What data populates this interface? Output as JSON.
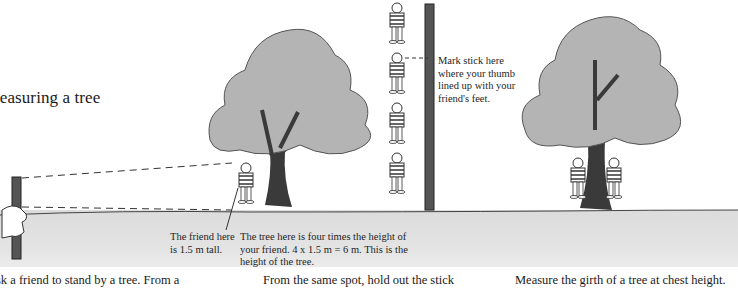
{
  "page": {
    "title_visible": "Ieasuring a tree"
  },
  "captions": {
    "friend": "The friend here is 1.5 m tall.",
    "tree_height": "The tree here is four times the height of your friend. 4 x  1.5 m = 6 m. This is the height of the tree.",
    "mark_stick": "Mark stick here where your thumb lined up with your friend's feet."
  },
  "body_text": {
    "col1": "sk a friend to stand by a tree. From a",
    "col2": "From the same spot, hold out the stick",
    "col3": "Measure the girth of a tree at chest height."
  },
  "illustrations": {
    "step1": "hand-holding-stick, sighting lines to friend beside tree",
    "step2": "four stacked friends beside marked stick",
    "step3": "two children hugging tree to measure girth"
  },
  "colors": {
    "foliage": "#b4b4b4",
    "trunk": "#3a3a3a",
    "ground": "#e0e0e0",
    "text": "#1e1e1e"
  }
}
